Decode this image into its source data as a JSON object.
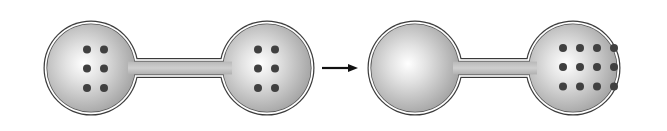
{
  "diagram": {
    "colors": {
      "glass_outline": "#3a3a3a",
      "glass_fill_center": "#ffffff",
      "glass_fill_edge": "#a9a9a9",
      "particle": "#404040",
      "arrow": "#111111",
      "background": "#ffffff"
    },
    "states": [
      {
        "label": "initial",
        "left_bulb_particles": 6,
        "right_bulb_particles": 6
      },
      {
        "label": "final",
        "left_bulb_particles": 0,
        "right_bulb_particles": 12
      }
    ],
    "arrow": {
      "direction": "right",
      "meaning": "transitions-to"
    }
  }
}
